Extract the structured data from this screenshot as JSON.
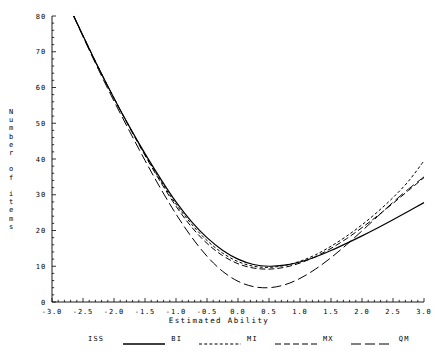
{
  "chart_data": {
    "type": "line",
    "title": "",
    "xlabel": "Estimated Ability",
    "ylabel": "Number of items",
    "xlim": [
      -3.0,
      3.0
    ],
    "ylim": [
      0,
      80
    ],
    "xticks": [
      "-3.0",
      "-2.5",
      "-2.0",
      "-1.5",
      "-1.0",
      "-0.5",
      "0.0",
      "0.5",
      "1.0",
      "1.5",
      "2.0",
      "2.5",
      "3.0"
    ],
    "yticks": [
      "0",
      "10",
      "20",
      "30",
      "40",
      "50",
      "60",
      "70",
      "80"
    ],
    "grid": false,
    "legend_position": "bottom",
    "legend_title": "ISS",
    "x": [
      -2.65,
      -2.5,
      -2.25,
      -2.0,
      -1.75,
      -1.5,
      -1.25,
      -1.0,
      -0.75,
      -0.5,
      -0.25,
      0.0,
      0.25,
      0.5,
      0.75,
      1.0,
      1.25,
      1.5,
      1.75,
      2.0,
      2.25,
      2.5,
      2.75,
      3.0
    ],
    "series": [
      {
        "name": "BI",
        "style": "solid",
        "values": [
          80.0,
          74.5,
          65.5,
          57.0,
          49.0,
          41.5,
          34.5,
          28.0,
          22.5,
          18.0,
          14.5,
          12.0,
          10.5,
          10.0,
          10.3,
          11.2,
          12.6,
          14.4,
          16.4,
          18.5,
          20.7,
          23.0,
          25.4,
          27.8
        ]
      },
      {
        "name": "MI",
        "style": "dashed-fine",
        "values": [
          80.0,
          74.5,
          65.5,
          57.0,
          49.0,
          41.3,
          34.0,
          27.4,
          21.8,
          17.2,
          13.7,
          11.3,
          10.0,
          9.7,
          10.2,
          11.4,
          13.2,
          15.6,
          18.4,
          21.6,
          25.2,
          29.2,
          33.8,
          39.5
        ]
      },
      {
        "name": "MX",
        "style": "dashed-medium",
        "values": [
          80.0,
          74.5,
          65.5,
          57.0,
          48.8,
          41.0,
          33.6,
          26.8,
          21.0,
          16.4,
          13.0,
          10.7,
          9.5,
          9.2,
          9.7,
          10.9,
          12.7,
          15.0,
          17.7,
          20.8,
          24.1,
          27.6,
          31.2,
          34.8
        ]
      },
      {
        "name": "QM",
        "style": "dashed-long",
        "values": [
          80.0,
          74.2,
          65.0,
          56.2,
          47.8,
          39.6,
          31.8,
          24.6,
          18.2,
          12.8,
          8.6,
          5.8,
          4.3,
          4.0,
          4.8,
          6.6,
          9.2,
          12.4,
          16.0,
          19.9,
          23.9,
          27.9,
          31.6,
          35.0
        ]
      }
    ]
  }
}
